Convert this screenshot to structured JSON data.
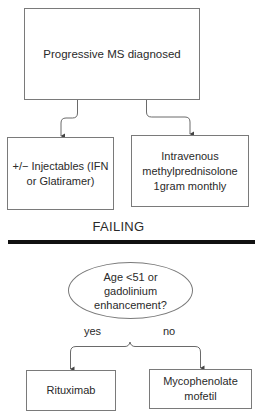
{
  "diagram": {
    "top_node": {
      "label": "Progressive MS diagnosed"
    },
    "first_line": [
      {
        "id": "injectables",
        "label": "+/− Injectables (IFN\nor Glatiramer)"
      },
      {
        "id": "ivmp",
        "label": "Intravenous\nmethylprednisolone\n1gram monthly"
      }
    ],
    "section_label": "FAILING",
    "decision": {
      "label": "Age <51 or\ngadolinium\nenhancement?"
    },
    "branches": {
      "yes": {
        "label": "yes",
        "target": "Rituximab"
      },
      "no": {
        "label": "no",
        "target": "Mycophenolate\nmofetil"
      }
    },
    "colors": {
      "box_border": "#7a7a7a",
      "connector": "#6a6a6a",
      "divider": "#111111",
      "text": "#2a2a2a"
    }
  }
}
